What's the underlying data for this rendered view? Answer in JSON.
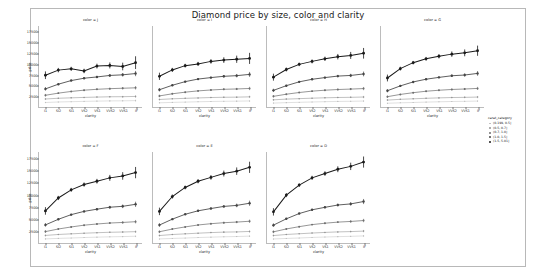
{
  "title": "Diamond price by size, color and clarity",
  "axis": {
    "xlabel": "clarity",
    "ylabel": "price",
    "x_categories": [
      "I1",
      "SI2",
      "SI1",
      "VS2",
      "VS1",
      "VVS2",
      "VVS1",
      "IF"
    ],
    "y_ticks": [
      2500,
      5000,
      7500,
      10000,
      12500,
      15000,
      17500
    ],
    "ylim": [
      0,
      19000
    ]
  },
  "legend": {
    "title": "carat_category",
    "entries": [
      {
        "label": "(0.199, 0.5]",
        "color": "#b9b9b9",
        "size": 1.6
      },
      {
        "label": "(0.5, 0.7]",
        "color": "#949494",
        "size": 1.8
      },
      {
        "label": "(0.7, 1.0]",
        "color": "#6e6e6e",
        "size": 2.0
      },
      {
        "label": "(1.0, 1.5]",
        "color": "#454545",
        "size": 2.3
      },
      {
        "label": "(1.5, 5.01]",
        "color": "#1a1a1a",
        "size": 2.6
      }
    ]
  },
  "chart_data": {
    "type": "line",
    "title": "Diamond price by size, color and clarity",
    "xlabel": "clarity",
    "ylabel": "price",
    "categories": [
      "I1",
      "SI2",
      "SI1",
      "VS2",
      "VS1",
      "VVS2",
      "VVS1",
      "IF"
    ],
    "ylim": [
      0,
      19000
    ],
    "y_ticks": [
      2500,
      5000,
      7500,
      10000,
      12500,
      15000,
      17500
    ],
    "grid": false,
    "legend_position": "right",
    "legend_title": "carat_category",
    "facet_variable": "color",
    "facet_rows": 2,
    "facet_cols": 4,
    "error_bars": "95% CI",
    "facets": [
      {
        "label": "color = J",
        "series": [
          {
            "name": "(0.199, 0.5]",
            "values": [
              1050,
              1180,
              1250,
              1320,
              1380,
              1430,
              1450,
              1500
            ],
            "err": [
              180,
              70,
              60,
              70,
              90,
              120,
              150,
              260
            ]
          },
          {
            "name": "(0.5, 0.7]",
            "values": [
              1880,
              2050,
              2150,
              2250,
              2330,
              2400,
              2420,
              2480
            ],
            "err": [
              240,
              90,
              80,
              90,
              110,
              150,
              190,
              320
            ]
          },
          {
            "name": "(0.7, 1.0]",
            "values": [
              2750,
              3250,
              3650,
              3950,
              4150,
              4300,
              4400,
              4500
            ],
            "err": [
              320,
              130,
              110,
              130,
              160,
              220,
              280,
              420
            ]
          },
          {
            "name": "(1.0, 1.5]",
            "values": [
              4250,
              5350,
              6200,
              6750,
              7050,
              7400,
              7550,
              7850
            ],
            "err": [
              420,
              210,
              180,
              200,
              240,
              330,
              420,
              620
            ]
          },
          {
            "name": "(1.5, 5.01]",
            "values": [
              7450,
              8650,
              8950,
              8450,
              9600,
              9750,
              9500,
              10400,
              11900
            ],
            "err": [
              900,
              520,
              480,
              520,
              560,
              700,
              900,
              1500
            ]
          }
        ]
      },
      {
        "label": "color = I",
        "series": [
          {
            "name": "(0.199, 0.5]",
            "values": [
              980,
              1080,
              1150,
              1230,
              1290,
              1340,
              1370,
              1420
            ],
            "err": [
              170,
              60,
              50,
              60,
              80,
              110,
              140,
              210
            ]
          },
          {
            "name": "(0.5, 0.7]",
            "values": [
              1760,
              1920,
              2030,
              2130,
              2220,
              2280,
              2310,
              2380
            ],
            "err": [
              230,
              80,
              70,
              80,
              100,
              140,
              180,
              280
            ]
          },
          {
            "name": "(0.7, 1.0]",
            "values": [
              2600,
              3100,
              3480,
              3780,
              3990,
              4150,
              4230,
              4350
            ],
            "err": [
              310,
              120,
              100,
              120,
              150,
              200,
              260,
              390
            ]
          },
          {
            "name": "(1.0, 1.5]",
            "values": [
              4050,
              5100,
              5950,
              6550,
              6900,
              7200,
              7350,
              7650
            ],
            "err": [
              400,
              200,
              170,
              190,
              230,
              310,
              400,
              580
            ]
          },
          {
            "name": "(1.5, 5.01]",
            "values": [
              7200,
              8700,
              9700,
              10100,
              10700,
              11000,
              11200,
              11400
            ],
            "err": [
              850,
              480,
              440,
              480,
              530,
              660,
              850,
              1300
            ]
          }
        ]
      },
      {
        "label": "color = H",
        "series": [
          {
            "name": "(0.199, 0.5]",
            "values": [
              920,
              1020,
              1100,
              1180,
              1250,
              1310,
              1340,
              1400
            ],
            "err": [
              160,
              55,
              48,
              58,
              75,
              105,
              130,
              200
            ]
          },
          {
            "name": "(0.5, 0.7]",
            "values": [
              1680,
              1850,
              1960,
              2070,
              2160,
              2230,
              2270,
              2340
            ],
            "err": [
              220,
              75,
              65,
              78,
              95,
              135,
              170,
              270
            ]
          },
          {
            "name": "(0.7, 1.0]",
            "values": [
              2500,
              3000,
              3400,
              3720,
              3940,
              4100,
              4200,
              4320
            ],
            "err": [
              300,
              115,
              95,
              115,
              145,
              195,
              250,
              380
            ]
          },
          {
            "name": "(1.0, 1.5]",
            "values": [
              3900,
              5000,
              5900,
              6500,
              6900,
              7250,
              7400,
              7750
            ],
            "err": [
              390,
              190,
              165,
              185,
              225,
              300,
              390,
              560
            ]
          },
          {
            "name": "(1.5, 5.01]",
            "values": [
              7000,
              8800,
              10000,
              10700,
              11300,
              11800,
              12100,
              12600
            ],
            "err": [
              820,
              460,
              420,
              460,
              510,
              640,
              820,
              1250
            ]
          }
        ]
      },
      {
        "label": "color = G",
        "series": [
          {
            "name": "(0.199, 0.5]",
            "values": [
              880,
              980,
              1060,
              1150,
              1220,
              1290,
              1330,
              1390
            ],
            "err": [
              155,
              52,
              45,
              55,
              72,
              100,
              125,
              190
            ]
          },
          {
            "name": "(0.5, 0.7]",
            "values": [
              1620,
              1800,
              1920,
              2040,
              2140,
              2220,
              2260,
              2330
            ],
            "err": [
              215,
              72,
              62,
              75,
              92,
              130,
              165,
              260
            ]
          },
          {
            "name": "(0.7, 1.0]",
            "values": [
              2420,
              2950,
              3360,
              3700,
              3930,
              4110,
              4220,
              4360
            ],
            "err": [
              295,
              112,
              92,
              112,
              142,
              190,
              245,
              370
            ]
          },
          {
            "name": "(1.0, 1.5]",
            "values": [
              3820,
              4950,
              5880,
              6520,
              6950,
              7330,
              7500,
              7880
            ],
            "err": [
              385,
              185,
              160,
              180,
              220,
              295,
              385,
              550
            ]
          },
          {
            "name": "(1.5, 5.01]",
            "values": [
              6800,
              9000,
              10400,
              11300,
              11900,
              12400,
              12700,
              13200
            ],
            "err": [
              800,
              450,
              410,
              450,
              500,
              630,
              800,
              1200
            ]
          }
        ]
      },
      {
        "label": "color = F",
        "series": [
          {
            "name": "(0.199, 0.5]",
            "values": [
              860,
              960,
              1040,
              1140,
              1220,
              1290,
              1340,
              1410
            ],
            "err": [
              150,
              50,
              43,
              53,
              70,
              98,
              120,
              185
            ]
          },
          {
            "name": "(0.5, 0.7]",
            "values": [
              1580,
              1780,
              1910,
              2040,
              2150,
              2240,
              2290,
              2370
            ],
            "err": [
              210,
              70,
              60,
              72,
              90,
              126,
              160,
              255
            ]
          },
          {
            "name": "(0.7, 1.0]",
            "values": [
              2380,
              2920,
              3350,
              3720,
              3970,
              4170,
              4290,
              4450
            ],
            "err": [
              290,
              110,
              90,
              110,
              140,
              186,
              240,
              365
            ]
          },
          {
            "name": "(1.0, 1.5]",
            "values": [
              3780,
              4950,
              5920,
              6600,
              7060,
              7470,
              7660,
              8080
            ],
            "err": [
              380,
              182,
              158,
              178,
              216,
              290,
              380,
              545
            ]
          },
          {
            "name": "(1.5, 5.01]",
            "values": [
              6700,
              9400,
              11100,
              12200,
              12900,
              13600,
              14000,
              14700
            ],
            "err": [
              790,
              440,
              400,
              440,
              490,
              620,
              790,
              1180
            ]
          }
        ]
      },
      {
        "label": "color = E",
        "series": [
          {
            "name": "(0.199, 0.5]",
            "values": [
              850,
              950,
              1030,
              1140,
              1220,
              1300,
              1350,
              1430
            ],
            "err": [
              148,
              49,
              42,
              52,
              69,
              96,
              118,
              182
            ]
          },
          {
            "name": "(0.5, 0.7]",
            "values": [
              1560,
              1770,
              1910,
              2050,
              2170,
              2270,
              2320,
              2410
            ],
            "err": [
              208,
              69,
              59,
              71,
              89,
              124,
              158,
              252
            ]
          },
          {
            "name": "(0.7, 1.0]",
            "values": [
              2350,
              2910,
              3360,
              3760,
              4030,
              4240,
              4370,
              4540
            ],
            "err": [
              288,
              108,
              88,
              108,
              138,
              184,
              237,
              360
            ]
          },
          {
            "name": "(1.0, 1.5]",
            "values": [
              3750,
              4980,
              6000,
              6720,
              7200,
              7640,
              7850,
              8300
            ],
            "err": [
              377,
              180,
              156,
              176,
              214,
              287,
              377,
              540
            ]
          },
          {
            "name": "(1.5, 5.01]",
            "values": [
              6600,
              9700,
              11600,
              12900,
              13700,
              14500,
              15000,
              15800
            ],
            "err": [
              780,
              435,
              395,
              435,
              485,
              615,
              780,
              1170
            ]
          }
        ]
      },
      {
        "label": "color = D",
        "series": [
          {
            "name": "(0.199, 0.5]",
            "values": [
              840,
              950,
              1040,
              1160,
              1250,
              1330,
              1390,
              1480
            ],
            "err": [
              146,
              48,
              41,
              51,
              68,
              95,
              116,
              180
            ]
          },
          {
            "name": "(0.5, 0.7]",
            "values": [
              1550,
              1780,
              1930,
              2080,
              2210,
              2320,
              2380,
              2480
            ],
            "err": [
              206,
              68,
              58,
              70,
              88,
              122,
              156,
              250
            ]
          },
          {
            "name": "(0.7, 1.0]",
            "values": [
              2330,
              2930,
              3410,
              3840,
              4130,
              4360,
              4500,
              4690
            ],
            "err": [
              286,
              106,
              86,
              106,
              136,
              182,
              235,
              356
            ]
          },
          {
            "name": "(1.0, 1.5]",
            "values": [
              3730,
              5050,
              6150,
              6930,
              7450,
              7930,
              8160,
              8660
            ],
            "err": [
              375,
              178,
              154,
              174,
              212,
              284,
              375,
              535
            ]
          },
          {
            "name": "(1.5, 5.01]",
            "values": [
              6500,
              10000,
              12100,
              13600,
              14500,
              15400,
              16000,
              16900
            ],
            "err": [
              770,
              430,
              390,
              430,
              480,
              610,
              770,
              1160
            ]
          }
        ]
      }
    ]
  }
}
